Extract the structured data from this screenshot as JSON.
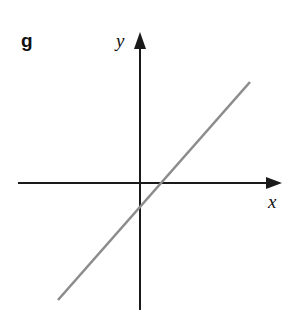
{
  "figure": {
    "panel_letter": "g",
    "background_color": "#ffffff",
    "width": 301,
    "height": 319
  },
  "axes": {
    "x_axis": {
      "label": "x",
      "color": "#1a1a1a",
      "start_x": 18,
      "end_x": 282,
      "y": 183,
      "arrow": "right"
    },
    "y_axis": {
      "label": "y",
      "color": "#1a1a1a",
      "x": 140,
      "start_y": 310,
      "end_y": 33,
      "arrow": "up"
    },
    "origin": {
      "x": 140,
      "y": 183
    }
  },
  "chart_data": {
    "type": "line",
    "title": "g",
    "xlabel": "x",
    "ylabel": "y",
    "grid": false,
    "legend": null,
    "axis_arrows": true,
    "series": [
      {
        "name": "g",
        "color": "#8c8c8c",
        "description": "straight line with positive slope, negative y-intercept, positive x-intercept",
        "points_px": [
          [
            58,
            300
          ],
          [
            250,
            82
          ]
        ],
        "x_intercept_px": 163,
        "y_intercept_px": 205,
        "slope_sign": "positive",
        "y_intercept_sign": "negative",
        "x_intercept_sign": "positive"
      }
    ]
  }
}
